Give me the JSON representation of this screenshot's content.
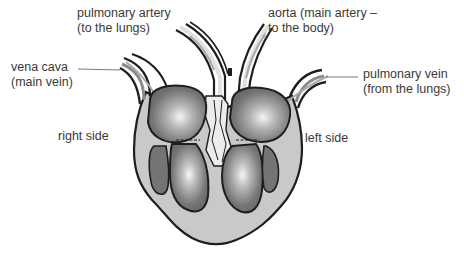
{
  "diagram": {
    "style": "grayscale illustration",
    "colors": {
      "outline": "#1e1e1e",
      "outer_wall": "#c9c9c9",
      "chamber_dark": "#6e6e6e",
      "chamber_highlight": "#f2f2f2",
      "septum_light": "#e6e6e6",
      "leader_line": "#7a7a7a",
      "flow_arrow": "#a8a8a8",
      "text": "#3a3a3a"
    },
    "labels": {
      "pulmonary_artery": {
        "line1": "pulmonary artery",
        "line2": "(to the lungs)"
      },
      "aorta": {
        "line1": "aorta (main artery –",
        "line2": "to the body)"
      },
      "vena_cava": {
        "line1": "vena cava",
        "line2": "(main vein)"
      },
      "pulmonary_vein": {
        "line1": "pulmonary vein",
        "line2": "(from the lungs)"
      },
      "right_side": "right side",
      "left_side": "left side"
    }
  }
}
